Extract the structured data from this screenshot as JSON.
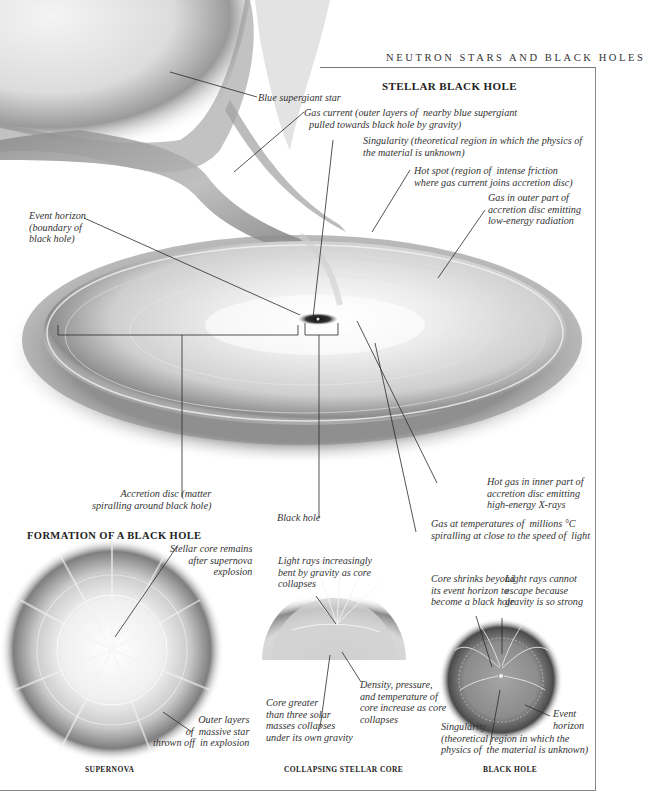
{
  "page": {
    "running_head": "NEUTRON STARS AND BLACK HOLES"
  },
  "stellar_black_hole": {
    "title": "STELLAR BLACK HOLE",
    "labels": {
      "blue_supergiant": "Blue supergiant star",
      "gas_current": "Gas current (outer layers of  nearby blue supergiant\n  pulled towards black hole by gravity)",
      "singularity": "Singularity (theoretical region in which the physics of\nthe material is unknown)",
      "hot_spot": "Hot spot (region of  intense friction\nwhere gas current joins accretion disc)",
      "gas_outer": "Gas in outer part of\naccretion disc emitting\nlow-energy radiation",
      "event_horizon": "Event horizon\n(boundary of\nblack hole)",
      "accretion_disc": "Accretion disc (matter\nspiralling around black hole)",
      "black_hole": "Black hole",
      "hot_gas_inner": "Hot gas in inner part of\naccretion disc emitting\nhigh-energy X-rays",
      "gas_temperatures": "Gas at temperatures of  millions °C\nspiralling at close to the speed of  light"
    }
  },
  "formation": {
    "title": "FORMATION OF A BLACK HOLE",
    "panels": [
      {
        "caption": "SUPERNOVA",
        "labels": {
          "stellar_core": "Stellar core remains\nafter supernova\nexplosion",
          "outer_layers": "Outer layers\nof  massive star\nthrown off  in explosion"
        }
      },
      {
        "caption": "COLLAPSING STELLAR CORE",
        "labels": {
          "light_rays_bent": "Light rays increasingly\nbent by gravity as core\ncollapses",
          "density": "Density, pressure,\nand temperature of\ncore increase as core\ncollapses",
          "core_greater": "Core greater\nthan three solar\nmasses collapses\nunder its own gravity"
        }
      },
      {
        "caption": "BLACK HOLE",
        "labels": {
          "core_shrinks": "Core shrinks beyond\nits event horizon to\nbecome a black hole",
          "light_cannot_escape": "Light rays cannot\nescape because\ngravity is so strong",
          "event_horizon": "Event\nhorizon",
          "singularity": "Singularity\n(theoretical region in which the\nphysics of  the material is unknown)"
        }
      }
    ]
  },
  "colors": {
    "line": "#2a2a2a",
    "frame": "#888888",
    "text": "#333333"
  }
}
